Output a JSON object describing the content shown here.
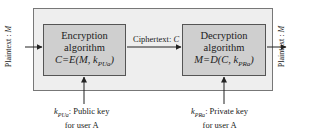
{
  "diagram": {
    "type": "public-key-encryption-flow",
    "input_label": {
      "prefix": "Plaintext : ",
      "var": "M"
    },
    "output_label": {
      "prefix": "Plaintext : ",
      "var": "M"
    },
    "encryption": {
      "title_line1": "Encryption",
      "title_line2": "algorithm",
      "formula_main": "C=E(M, k",
      "formula_sub": "PUa",
      "formula_end": ")"
    },
    "ciphertext_label": {
      "prefix": "Ciphertext: ",
      "var": "C"
    },
    "decryption": {
      "title_line1": "Decryption",
      "title_line2": "algorithm",
      "formula_main": "M=D(C, k",
      "formula_sub": "PRa",
      "formula_end": ")"
    },
    "public_key": {
      "k": "k",
      "sub": "PUa",
      "text": ": Public key",
      "line2": "for user A"
    },
    "private_key": {
      "k": "k",
      "sub": "PRa",
      "text": ": Private key",
      "line2": "for user A"
    },
    "colors": {
      "outer_fill": "#eeeeee",
      "box_fill": "#cfcfcf",
      "stroke": "#555555"
    }
  }
}
